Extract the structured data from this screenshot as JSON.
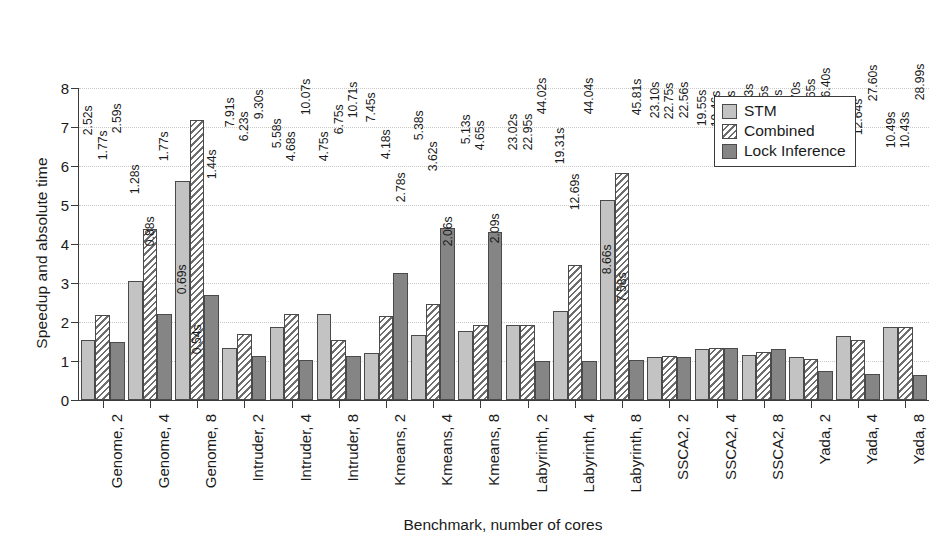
{
  "chart_data": {
    "type": "bar",
    "title": "",
    "xlabel": "Benchmark, number of cores",
    "ylabel": "Speedup and absolute time",
    "ylim": [
      0,
      8
    ],
    "yticks": [
      0,
      1,
      2,
      3,
      4,
      5,
      6,
      7,
      8
    ],
    "grid": true,
    "legend_position": "top-right",
    "categories": [
      "Genome, 2",
      "Genome, 4",
      "Genome, 8",
      "Intruder, 2",
      "Intruder, 4",
      "Intruder, 8",
      "Kmeans, 2",
      "Kmeans, 4",
      "Kmeans, 8",
      "Labyrinth, 2",
      "Labyrinth, 4",
      "Labyrinth, 8",
      "SSCA2, 2",
      "SSCA2, 4",
      "SSCA2, 8",
      "Yada, 2",
      "Yada, 4",
      "Yada, 8"
    ],
    "series": [
      {
        "name": "STM",
        "color": "#c3c3c3",
        "values": [
          1.55,
          3.05,
          5.62,
          1.33,
          1.88,
          2.2,
          1.2,
          1.67,
          1.78,
          1.93,
          2.28,
          5.12,
          1.1,
          1.32,
          1.15,
          1.11,
          1.65,
          1.87
        ]
      },
      {
        "name": "Combined",
        "color": "#ffffff",
        "hatch": "diagonal",
        "values": [
          2.19,
          4.38,
          7.17,
          1.7,
          2.21,
          1.53,
          2.15,
          2.47,
          1.92,
          1.93,
          3.47,
          5.82,
          1.13,
          1.33,
          1.22,
          1.04,
          1.55,
          1.87
        ]
      },
      {
        "name": "Lock Inference",
        "color": "#858585",
        "values": [
          1.49,
          2.21,
          2.68,
          1.14,
          1.02,
          1.12,
          3.25,
          4.4,
          4.32,
          1.0,
          1.0,
          1.03,
          1.1,
          1.33,
          1.31,
          0.74,
          0.67,
          0.64
        ]
      }
    ],
    "top_time_labels": [
      [
        "2.52s",
        "1.77s",
        "2.59s"
      ],
      [
        "1.28s",
        "0.88s",
        "1.77s"
      ],
      [
        "0.69s",
        "0.54s",
        "1.44s"
      ],
      [
        "7.91s",
        "6.23s",
        "9.30s"
      ],
      [
        "5.58s",
        "4.68s",
        "10.07s"
      ],
      [
        "4.75s",
        "6.75s",
        "10.71s"
      ],
      [
        "7.45s",
        "4.18s",
        "2.78s"
      ],
      [
        "5.38s",
        "3.62s",
        "2.06s"
      ],
      [
        "5.13s",
        "4.65s",
        "2.09s"
      ],
      [
        "23.02s",
        "22.95s",
        "44.02s"
      ],
      [
        "19.31s",
        "12.69s",
        "44.04s"
      ],
      [
        "8.66s",
        "7.58s",
        "45.81s"
      ],
      [
        "23.10s",
        "22.75s",
        "22.56s"
      ],
      [
        "19.55s",
        "19.46s",
        "19.44s"
      ],
      [
        "21.93s",
        "18.25s",
        "20.10s"
      ],
      [
        "17.70s",
        "18.65s",
        "26.40s"
      ],
      [
        "11.68s",
        "12.64s",
        "27.60s"
      ],
      [
        "10.49s",
        "10.43s",
        "28.99s"
      ]
    ]
  },
  "legend": {
    "items": [
      {
        "label": "STM",
        "swatch": "stm"
      },
      {
        "label": "Combined",
        "swatch": "combined"
      },
      {
        "label": "Lock Inference",
        "swatch": "lock"
      }
    ]
  }
}
